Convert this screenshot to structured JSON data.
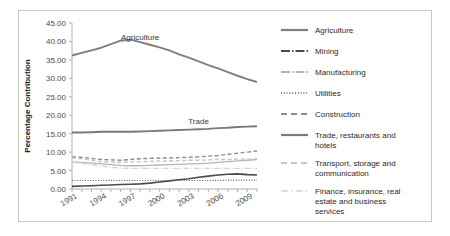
{
  "chart_data": {
    "type": "line",
    "title": "",
    "xlabel": "",
    "ylabel": "Percentage Contribution",
    "ylim": [
      0,
      45
    ],
    "ytick_labels": [
      "0.00",
      "5.00",
      "10.00",
      "15.00",
      "20.00",
      "25.00",
      "30.00",
      "35.00",
      "40.00",
      "45.00"
    ],
    "ytick_values": [
      0,
      5,
      10,
      15,
      20,
      25,
      30,
      35,
      40,
      45
    ],
    "x": [
      1991,
      1992,
      1993,
      1994,
      1995,
      1996,
      1997,
      1998,
      1999,
      2000,
      2001,
      2002,
      2003,
      2004,
      2005,
      2006,
      2007,
      2008,
      2009,
      2010
    ],
    "xtick_labels": [
      "1991",
      "1994",
      "1997",
      "2000",
      "2003",
      "2006",
      "2009"
    ],
    "xtick_label_values": [
      1991,
      1994,
      1997,
      2000,
      2003,
      2006,
      2009
    ],
    "grid": false,
    "legend_position": "right",
    "annotations": [
      {
        "text": "Agriculture",
        "x": 1998,
        "y": 40.5
      },
      {
        "text": "Trade",
        "x": 2004,
        "y": 17.6
      }
    ],
    "series": [
      {
        "name": "Agriculture",
        "color": "#7f7f7f",
        "width": 1.9,
        "dash": "none",
        "values": [
          36.2,
          36.9,
          37.6,
          38.3,
          39.3,
          40.2,
          40.5,
          39.8,
          39.1,
          38.4,
          37.6,
          36.5,
          35.6,
          34.6,
          33.6,
          32.7,
          31.7,
          30.7,
          29.8,
          29.0
        ]
      },
      {
        "name": "Mining",
        "color": "#4a4a4a",
        "width": 1.6,
        "dash": "none",
        "values": [
          0.7,
          0.8,
          0.9,
          1.0,
          1.1,
          1.2,
          1.3,
          1.4,
          1.6,
          1.9,
          2.2,
          2.5,
          2.8,
          3.2,
          3.5,
          3.8,
          4.0,
          4.1,
          3.9,
          3.8
        ]
      },
      {
        "name": "Manufacturing",
        "color": "#b5b5b5",
        "width": 1.3,
        "dash": "none",
        "values": [
          7.3,
          7.2,
          7.0,
          6.8,
          6.6,
          6.4,
          6.3,
          6.3,
          6.4,
          6.5,
          6.6,
          6.7,
          6.8,
          6.9,
          7.0,
          7.2,
          7.4,
          7.6,
          7.8,
          8.0
        ]
      },
      {
        "name": "Utilities",
        "color": "#595959",
        "width": 1.2,
        "dash": "1,1.6",
        "values": [
          2.3,
          2.3,
          2.3,
          2.3,
          2.3,
          2.3,
          2.3,
          2.3,
          2.3,
          2.3,
          2.3,
          2.3,
          2.3,
          2.3,
          2.3,
          2.3,
          2.4,
          2.4,
          2.4,
          2.4
        ]
      },
      {
        "name": "Construction",
        "color": "#8c8c8c",
        "width": 1.4,
        "dash": "4,2.5",
        "values": [
          8.7,
          8.6,
          8.3,
          8.0,
          7.9,
          7.8,
          8.0,
          8.2,
          8.3,
          8.4,
          8.4,
          8.5,
          8.6,
          8.7,
          8.9,
          9.1,
          9.4,
          9.7,
          10.0,
          10.3
        ]
      },
      {
        "name": "Trade, restaurants and hotels",
        "color": "#7a7a7a",
        "width": 1.9,
        "dash": "none",
        "values": [
          15.3,
          15.3,
          15.4,
          15.5,
          15.5,
          15.5,
          15.5,
          15.6,
          15.7,
          15.8,
          15.9,
          16.0,
          16.1,
          16.2,
          16.3,
          16.5,
          16.6,
          16.8,
          16.9,
          17.0
        ]
      },
      {
        "name": "Transport, storage and communication",
        "color": "#c6c6c6",
        "width": 1.4,
        "dash": "4,2.5",
        "values": [
          8.4,
          8.2,
          7.8,
          7.4,
          7.3,
          7.2,
          7.3,
          7.4,
          7.5,
          7.6,
          7.6,
          7.7,
          7.8,
          7.8,
          7.9,
          8.0,
          8.0,
          8.1,
          8.1,
          8.2
        ]
      },
      {
        "name": "Finance, insurance, real estate and business services",
        "color": "#d2d2d2",
        "width": 1.3,
        "dash": "5,2,1.2,2",
        "values": [
          7.2,
          7.0,
          6.6,
          6.2,
          5.9,
          5.7,
          5.6,
          5.6,
          5.6,
          5.6,
          5.6,
          5.6,
          5.6,
          5.6,
          5.6,
          5.6,
          5.6,
          5.6,
          5.6,
          5.6
        ]
      }
    ]
  },
  "legend": {
    "items": [
      {
        "label": "Agriculture",
        "color": "#7f7f7f",
        "width": 2.2,
        "dash": "none"
      },
      {
        "label": "Mining",
        "color": "#4a4a4a",
        "width": 2.2,
        "dash": "9,2,1.5,2"
      },
      {
        "label": "Manufacturing",
        "color": "#b5b5b5",
        "width": 1.8,
        "dash": "9,2,1.5,2"
      },
      {
        "label": "Utilities",
        "color": "#595959",
        "width": 1.6,
        "dash": "1,1.8"
      },
      {
        "label": "Construction",
        "color": "#8c8c8c",
        "width": 1.8,
        "dash": "6,4"
      },
      {
        "label": "Trade, restaurants and hotels",
        "color": "#7a7a7a",
        "width": 2.2,
        "dash": "none"
      },
      {
        "label": "Transport, storage and communication",
        "color": "#c6c6c6",
        "width": 1.8,
        "dash": "6,4"
      },
      {
        "label": "Finance, insurance, real estate and business services",
        "color": "#d2d2d2",
        "width": 1.6,
        "dash": "7,3,1.5,3"
      }
    ]
  }
}
